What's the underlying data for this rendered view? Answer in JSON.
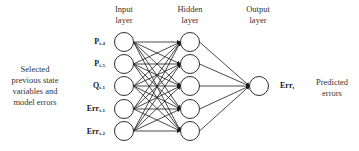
{
  "layers": {
    "input": {
      "title_line1": "Input",
      "title_line2": "layer"
    },
    "hidden": {
      "title_line1": "Hidden",
      "title_line2": "layer"
    },
    "output": {
      "title_line1": "Output",
      "title_line2": "layer"
    }
  },
  "left_description": {
    "lines": [
      "Selected",
      "previous state",
      "variables and",
      "model errors"
    ]
  },
  "right_description": {
    "lines": [
      "Predicted",
      "errors"
    ]
  },
  "inputs": [
    {
      "base": "P",
      "sub": "t-4"
    },
    {
      "base": "P",
      "sub": "t-5"
    },
    {
      "base": "Q",
      "sub": "t-1"
    },
    {
      "base": "Err",
      "sub": "t-1"
    },
    {
      "base": "Err",
      "sub": "t-2"
    }
  ],
  "output_var": {
    "base": "Err",
    "sub": "t"
  },
  "structure": {
    "input_nodes": 5,
    "hidden_nodes": 5,
    "output_nodes": 1,
    "connectivity": "fully-connected feedforward"
  },
  "colors": {
    "stroke": "#1a1a1a",
    "node_fill": "#ffffff",
    "text": "#222222"
  }
}
